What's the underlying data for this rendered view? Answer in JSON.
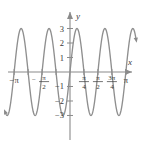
{
  "figure": {
    "kind": "cartesian-plot",
    "background_color": "#ffffff",
    "curve_color": "#8f8f8f",
    "axis_color": "#8a8a8a",
    "label_color": "#3a3a3a"
  },
  "axes": {
    "x_axis_label": "x",
    "y_axis_label": "y",
    "x_ticks": [
      {
        "value": -3.14159265,
        "label": "−π",
        "kind": "plain"
      },
      {
        "value": -2.35619449,
        "label": "",
        "kind": "none"
      },
      {
        "value": -1.57079633,
        "label": "−π/2",
        "kind": "fraction",
        "sign": "−",
        "num": "π",
        "den": "2"
      },
      {
        "value": -0.78539816,
        "label": "",
        "kind": "none"
      },
      {
        "value": 0.78539816,
        "label": "π/4",
        "kind": "fraction",
        "sign": "",
        "num": "π",
        "den": "4"
      },
      {
        "value": 1.57079633,
        "label": "π/2",
        "kind": "fraction",
        "sign": "",
        "num": "π",
        "den": "2"
      },
      {
        "value": 2.35619449,
        "label": "3π/4",
        "kind": "fraction",
        "sign": "",
        "num": "3π",
        "den": "4"
      },
      {
        "value": 3.14159265,
        "label": "π",
        "kind": "plain"
      }
    ],
    "y_ticks": [
      {
        "value": 3,
        "label": "3"
      },
      {
        "value": 2,
        "label": "2"
      },
      {
        "value": 1,
        "label": "1"
      },
      {
        "value": -1,
        "label": "−1"
      },
      {
        "value": -2,
        "label": "−2"
      },
      {
        "value": -3,
        "label": "−3"
      }
    ]
  },
  "chart_data": {
    "type": "line",
    "title": "",
    "subtitle": "",
    "xlabel": "x",
    "ylabel": "y",
    "xlim": [
      -3.6,
      3.7
    ],
    "ylim": [
      -3.45,
      3.45
    ],
    "grid": false,
    "legend": null,
    "x_tick_labels": [
      "−π",
      "−π/2",
      "π/4",
      "π/2",
      "3π/4",
      "π"
    ],
    "x_tick_values": [
      -3.14159265,
      -1.57079633,
      0.78539816,
      1.57079633,
      2.35619449,
      3.14159265
    ],
    "y_tick_labels": [
      "3",
      "2",
      "1",
      "−1",
      "−2",
      "−3"
    ],
    "y_tick_values": [
      3,
      2,
      1,
      -1,
      -2,
      -3
    ],
    "series": [
      {
        "name": "y = 3 sin(4x)",
        "amplitude": 3,
        "frequency": 4,
        "period": 1.5707963,
        "phase": 0,
        "color": "#8f8f8f",
        "x": [
          -3.6,
          -3.4,
          -3.2,
          -3.0,
          -2.8,
          -2.6,
          -2.4,
          -2.2,
          -2.0,
          -1.8,
          -1.6,
          -1.4,
          -1.2,
          -1.0,
          -0.8,
          -0.6,
          -0.4,
          -0.2,
          0.0,
          0.2,
          0.4,
          0.6,
          0.8,
          1.0,
          1.2,
          1.4,
          1.6,
          1.8,
          2.0,
          2.2,
          2.4,
          2.6,
          2.8,
          3.0,
          3.2,
          3.4,
          3.6
        ],
        "y": [
          2.68,
          0.79,
          -1.67,
          -2.95,
          -2.17,
          0.16,
          2.37,
          2.99,
          1.49,
          -1.02,
          -2.81,
          -2.64,
          -0.56,
          2.02,
          2.99,
          1.27,
          -1.29,
          -2.99,
          0.0,
          2.99,
          1.29,
          -1.27,
          -2.99,
          -2.02,
          0.56,
          2.64,
          2.81,
          1.02,
          -1.49,
          -2.99,
          -2.37,
          -0.16,
          2.17,
          2.95,
          1.67,
          -0.79,
          -2.68
        ]
      }
    ],
    "annotations": []
  }
}
